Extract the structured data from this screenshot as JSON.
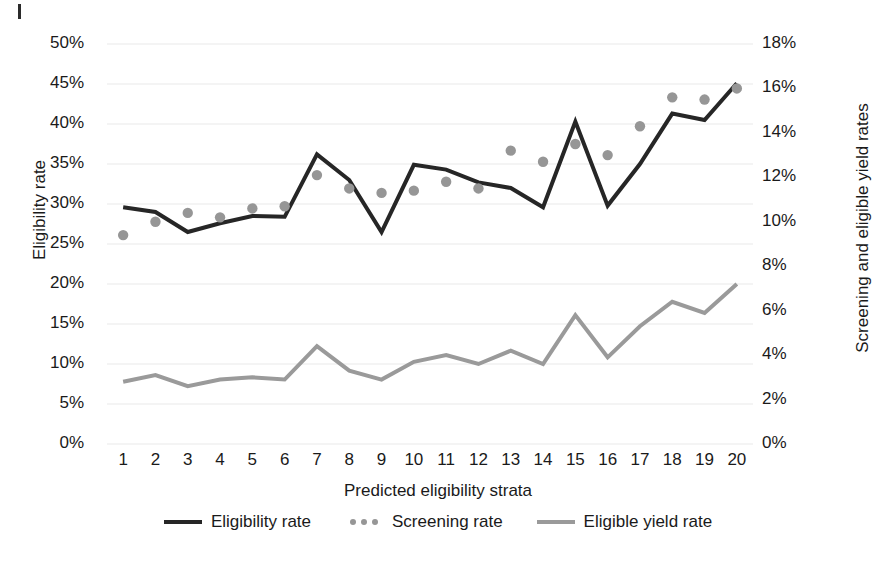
{
  "chart_data": {
    "type": "line",
    "title": "",
    "xlabel": "Predicted eligibility strata",
    "ylabel": "Eligibility rate",
    "y2label": "Screening and eligible yield rates",
    "grid": true,
    "legend_position": "bottom",
    "x": [
      1,
      2,
      3,
      4,
      5,
      6,
      7,
      8,
      9,
      10,
      11,
      12,
      13,
      14,
      15,
      16,
      17,
      18,
      19,
      20
    ],
    "categories": [
      "1",
      "2",
      "3",
      "4",
      "5",
      "6",
      "7",
      "8",
      "9",
      "10",
      "11",
      "12",
      "13",
      "14",
      "15",
      "16",
      "17",
      "18",
      "19",
      "20"
    ],
    "ylim": [
      0,
      50
    ],
    "yticks": [
      0,
      5,
      10,
      15,
      20,
      25,
      30,
      35,
      40,
      45,
      50
    ],
    "ytick_labels": [
      "0%",
      "5%",
      "10%",
      "15%",
      "20%",
      "25%",
      "30%",
      "35%",
      "40%",
      "45%",
      "50%"
    ],
    "y2lim": [
      0,
      18
    ],
    "y2ticks": [
      0,
      2,
      4,
      6,
      8,
      10,
      12,
      14,
      16,
      18
    ],
    "y2tick_labels": [
      "0%",
      "2%",
      "4%",
      "6%",
      "8%",
      "10%",
      "12%",
      "14%",
      "16%",
      "18%"
    ],
    "series": [
      {
        "name": "Eligibility rate",
        "style": "line",
        "axis": "left",
        "color": "#262626",
        "values": [
          29.6,
          29.0,
          26.5,
          27.6,
          28.5,
          28.4,
          36.2,
          33.0,
          26.5,
          34.9,
          34.3,
          32.7,
          32.0,
          29.6,
          40.3,
          29.8,
          35.0,
          41.3,
          40.5,
          45.1
        ]
      },
      {
        "name": "Screening rate",
        "style": "dots",
        "axis": "right",
        "color": "#969696",
        "values": [
          9.4,
          10.0,
          10.4,
          10.2,
          10.6,
          10.7,
          12.1,
          11.5,
          11.3,
          11.4,
          11.8,
          11.5,
          13.2,
          12.7,
          13.5,
          13.0,
          14.3,
          15.6,
          15.5,
          16.0
        ]
      },
      {
        "name": "Eligible yield rate",
        "style": "line",
        "axis": "right",
        "color": "#9a9a9a",
        "values": [
          2.8,
          3.1,
          2.6,
          2.9,
          3.0,
          2.9,
          4.4,
          3.3,
          2.9,
          3.7,
          4.0,
          3.6,
          4.2,
          3.6,
          5.8,
          3.9,
          5.3,
          6.4,
          5.9,
          7.2
        ]
      }
    ],
    "legend": [
      {
        "label": "Eligibility rate",
        "marker": "line",
        "color": "#262626"
      },
      {
        "label": "Screening rate",
        "marker": "dots",
        "color": "#969696"
      },
      {
        "label": "Eligible yield rate",
        "marker": "line",
        "color": "#9a9a9a"
      }
    ],
    "colors": {
      "eligibility_rate": "#262626",
      "screening_rate": "#969696",
      "eligible_yield_rate": "#9a9a9a",
      "gridline": "#e9e9e9",
      "text": "#1a1a1a",
      "background": "#ffffff"
    }
  }
}
